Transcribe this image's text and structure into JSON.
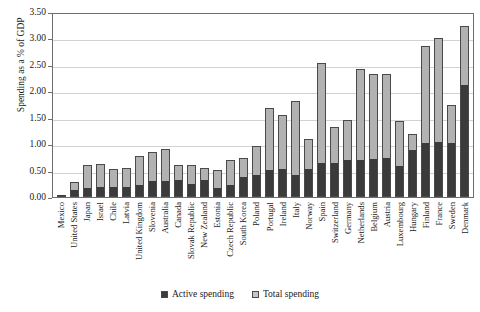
{
  "chart_data": {
    "type": "bar",
    "title": "",
    "subtitle": "",
    "xlabel": "",
    "ylabel": "Spending as a % of GDP",
    "ylim": [
      0.0,
      3.5
    ],
    "ytick_step": 0.5,
    "yticks": [
      "0.00",
      "0.50",
      "1.00",
      "1.50",
      "2.00",
      "2.50",
      "3.00",
      "3.50"
    ],
    "grid": true,
    "stacked": true,
    "legend_position": "bottom",
    "legend": [
      "Active spending",
      "Total spending"
    ],
    "colors": {
      "active_spending": "#3b3b3b",
      "total_spending": "#b2b2b2",
      "gridline": "#d2d2d2",
      "axis": "#6e6e6e"
    },
    "categories": [
      "Mexico",
      "United States",
      "Japan",
      "Israel",
      "Chile",
      "Latvia",
      "United Kingdom",
      "Slovenia",
      "Australia",
      "Canada",
      "Slovak Republic",
      "New Zealand",
      "Estonia",
      "Czech Republic",
      "South Korea",
      "Poland",
      "Portugal",
      "Ireland",
      "Italy",
      "Norway",
      "Spain",
      "Switzerland",
      "Germany",
      "Netherlands",
      "Belgium",
      "Austria",
      "Luxembourg",
      "Hungary",
      "Finland",
      "France",
      "Sweden",
      "Denmark"
    ],
    "series": [
      {
        "name": "Active spending",
        "values": [
          0.02,
          0.11,
          0.15,
          0.18,
          0.18,
          0.18,
          0.2,
          0.28,
          0.29,
          0.3,
          0.23,
          0.3,
          0.15,
          0.21,
          0.36,
          0.4,
          0.5,
          0.52,
          0.4,
          0.52,
          0.62,
          0.62,
          0.68,
          0.68,
          0.7,
          0.72,
          0.56,
          0.88,
          1.0,
          1.03,
          1.0,
          2.1
        ]
      },
      {
        "name": "Total spending",
        "values": [
          0.03,
          0.28,
          0.6,
          0.62,
          0.53,
          0.55,
          0.78,
          0.85,
          0.9,
          0.61,
          0.6,
          0.55,
          0.52,
          0.7,
          0.74,
          0.96,
          1.68,
          1.55,
          1.82,
          1.1,
          2.53,
          1.33,
          1.46,
          2.42,
          2.33,
          2.33,
          1.43,
          1.2,
          2.85,
          3.0,
          1.75,
          3.23
        ]
      }
    ]
  }
}
